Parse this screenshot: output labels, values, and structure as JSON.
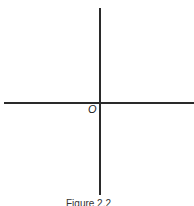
{
  "diagram": {
    "origin_label": "O",
    "caption": "Figure 2.2",
    "axis_color": "#2a2a2a"
  }
}
